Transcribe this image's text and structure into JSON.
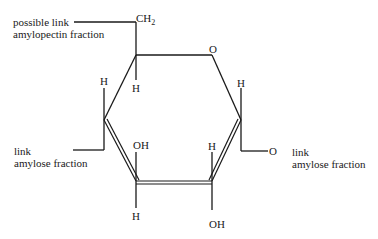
{
  "diagram": {
    "title": "",
    "type": "glucose ring structure (Haworth projection)",
    "atoms": {
      "ch2": "CH",
      "ch2_sub": "2",
      "ring_o": "O",
      "c5_h": "H",
      "c4_h": "H",
      "c1_h": "H",
      "c3_oh": "OH",
      "c3_h": "H",
      "c2_h": "H",
      "c2_oh": "OH",
      "c1_o": "O"
    },
    "annotations": {
      "top_left_line1": "possible link",
      "top_left_line2": "amylopectin fraction",
      "left_line1": "link",
      "left_line2": "amylose fraction",
      "right_line1": "link",
      "right_line2": "amylose fraction"
    }
  }
}
